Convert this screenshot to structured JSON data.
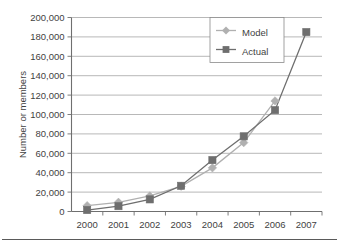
{
  "figure": {
    "name": "membership-growth-line-chart",
    "has_bottom_rule": true
  },
  "colors": {
    "model_series": "#b0b0b0",
    "actual_series": "#6e6e6e",
    "gridline": "#9a9a9a",
    "axis": "#6f6f6f",
    "text": "#3f3f3f",
    "background": "#ffffff",
    "legend_border": "#8a8a8a"
  },
  "axis": {
    "y_title": "Number or members",
    "x_title": "",
    "y_tick_labels": [
      "0",
      "20,000",
      "40,000",
      "60,000",
      "80,000",
      "100,000",
      "120,000",
      "140,000",
      "160,000",
      "180,000",
      "200,000"
    ],
    "x_tick_labels": [
      "2000",
      "2001",
      "2002",
      "2003",
      "2004",
      "2005",
      "2006",
      "2007"
    ]
  },
  "legend": {
    "position": "top-right",
    "entries": [
      {
        "label": "Model",
        "marker": "diamond-marker",
        "color": "#b0b0b0"
      },
      {
        "label": "Actual",
        "marker": "square-marker",
        "color": "#6e6e6e"
      }
    ]
  },
  "chart_data": {
    "type": "line",
    "title": "",
    "xlabel": "",
    "ylabel": "Number or members",
    "categories": [
      "2000",
      "2001",
      "2002",
      "2003",
      "2004",
      "2005",
      "2006",
      "2007"
    ],
    "x": [
      2000,
      2001,
      2002,
      2003,
      2004,
      2005,
      2006,
      2007
    ],
    "ylim": [
      0,
      200000
    ],
    "y_tick_step": 20000,
    "grid": true,
    "legend_position": "top-right",
    "series": [
      {
        "name": "Model",
        "marker": "diamond",
        "color": "#b0b0b0",
        "values": [
          6000,
          9500,
          16000,
          26000,
          45000,
          71000,
          114000,
          null
        ]
      },
      {
        "name": "Actual",
        "marker": "square",
        "color": "#6e6e6e",
        "values": [
          1500,
          5500,
          12500,
          26500,
          53000,
          77500,
          104500,
          185000
        ]
      }
    ]
  }
}
